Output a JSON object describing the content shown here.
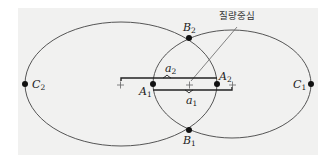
{
  "diagram": {
    "title_label": "질량중심",
    "points": {
      "C2": {
        "letter": "C",
        "sub": "2"
      },
      "C1": {
        "letter": "C",
        "sub": "1"
      },
      "B2": {
        "letter": "B",
        "sub": "2"
      },
      "B1": {
        "letter": "B",
        "sub": "1"
      },
      "A1": {
        "letter": "A",
        "sub": "1"
      },
      "A2": {
        "letter": "A",
        "sub": "2"
      }
    },
    "distances": {
      "a2": {
        "letter": "a",
        "sub": "2"
      },
      "a1": {
        "letter": "a",
        "sub": "1"
      }
    },
    "colors": {
      "background": "#ffffff",
      "panel": "#f1f1f0",
      "stroke": "#555555",
      "dot": "#111111"
    }
  }
}
